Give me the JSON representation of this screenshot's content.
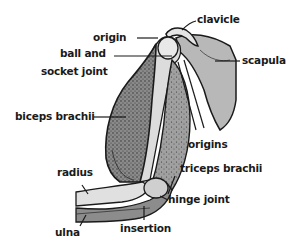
{
  "diagram": {
    "labels": {
      "origin": "origin",
      "ball_and": "ball and",
      "socket_joint": "socket joint",
      "biceps_brachii": "biceps brachii",
      "clavicle": "clavicle",
      "scapula": "scapula",
      "origins": "origins",
      "triceps_brachii": "triceps brachii",
      "hinge_joint": "hinge joint",
      "radius": "radius",
      "ulna": "ulna",
      "insertion": "insertion"
    },
    "colors": {
      "background": "#ffffff",
      "ink": "#1a1a1a",
      "muscle_dark": "#6e6e6e",
      "muscle_mid": "#9a9a9a",
      "bone_light": "#d9d9d9",
      "scapula_fill": "#b4b4b4"
    }
  }
}
